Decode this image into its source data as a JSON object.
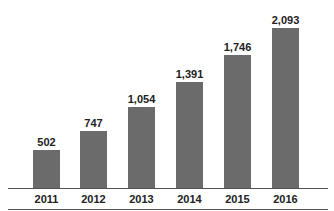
{
  "chart_data": {
    "type": "bar",
    "title": "",
    "xlabel": "",
    "ylabel": "",
    "categories": [
      "2011",
      "2012",
      "2013",
      "2014",
      "2015",
      "2016"
    ],
    "values": [
      502,
      747,
      1054,
      1391,
      1746,
      2093
    ],
    "value_labels": [
      "502",
      "747",
      "1,054",
      "1,391",
      "1,746",
      "2,093"
    ],
    "grid": false,
    "legend": null,
    "bar_color": "#6b6b6b"
  }
}
